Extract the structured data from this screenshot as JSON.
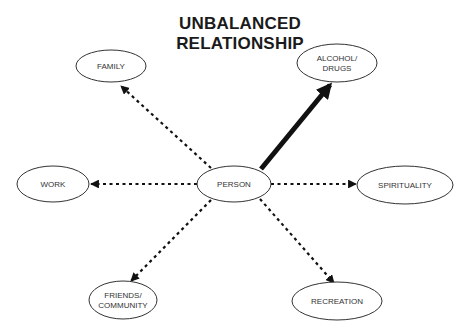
{
  "title": {
    "line1": "UNBALANCED",
    "line2": "RELATIONSHIP"
  },
  "center_node": {
    "id": "person",
    "lines": [
      "PERSON"
    ]
  },
  "nodes": [
    {
      "id": "family",
      "lines": [
        "FAMILY"
      ],
      "link": "dashed"
    },
    {
      "id": "alcohol-drugs",
      "lines": [
        "ALCOHOL/",
        "DRUGS"
      ],
      "link": "thick"
    },
    {
      "id": "work",
      "lines": [
        "WORK"
      ],
      "link": "dashed"
    },
    {
      "id": "spirituality",
      "lines": [
        "SPIRITUALITY"
      ],
      "link": "dashed"
    },
    {
      "id": "friends-community",
      "lines": [
        "FRIENDS/",
        "COMMUNITY"
      ],
      "link": "dashed"
    },
    {
      "id": "recreation",
      "lines": [
        "RECREATION"
      ],
      "link": "dashed"
    }
  ],
  "colors": {
    "stroke": "#333333",
    "arrow": "#111111"
  }
}
